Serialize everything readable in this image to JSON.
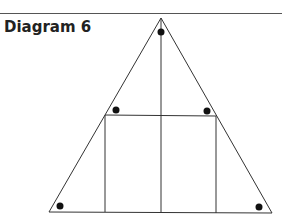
{
  "diagram": {
    "title": "Diagram 6",
    "elements": {
      "triangle": {
        "vertices": [
          "apex",
          "bottom-left",
          "bottom-right"
        ]
      },
      "median": {
        "from": "apex",
        "to": "base-midpoint"
      },
      "rectangle": {
        "description": "inscribed rectangle with top corners on the triangle sides"
      },
      "angle_markers": [
        "apex",
        "bottom-left",
        "bottom-right",
        "rectangle-top-left",
        "rectangle-top-right"
      ]
    },
    "colors": {
      "line": "#333333",
      "dot": "#111111"
    }
  }
}
